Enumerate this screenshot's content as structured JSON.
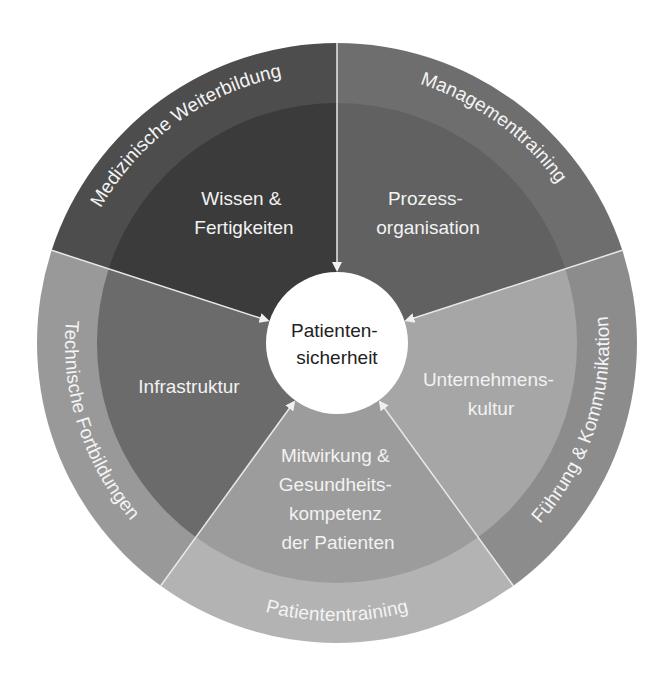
{
  "diagram": {
    "center": {
      "lines": [
        "Patienten-",
        "sicherheit"
      ],
      "fill": "#ffffff"
    },
    "segments": [
      {
        "id": "wissen",
        "outer_label": "Medizinische Weiterbildung",
        "inner_lines": [
          "Wissen &",
          "Fertigkeiten"
        ],
        "outer_color": "#4d4d4d",
        "inner_color": "#3b3b3b"
      },
      {
        "id": "prozess",
        "outer_label": "Managementtraining",
        "inner_lines": [
          "Prozess-",
          "organisation"
        ],
        "outer_color": "#6e6e6e",
        "inner_color": "#616161"
      },
      {
        "id": "kultur",
        "outer_label": "Führung & Kommunikation",
        "inner_lines": [
          "Unternehmens-",
          "kultur"
        ],
        "outer_color": "#8c8c8c",
        "inner_color": "#a6a6a6"
      },
      {
        "id": "patienten",
        "outer_label": "Patiententraining",
        "inner_lines": [
          "Mitwirkung &",
          "Gesundheits-",
          "kompetenz",
          "der Patienten"
        ],
        "outer_color": "#b3b3b3",
        "inner_color": "#9c9c9c"
      },
      {
        "id": "infrastruktur",
        "outer_label": "Technische Fortbildungen",
        "inner_lines": [
          "Infrastruktur"
        ],
        "outer_color": "#999999",
        "inner_color": "#6b6b6b"
      }
    ],
    "separator_color": "#e6e6e6"
  }
}
